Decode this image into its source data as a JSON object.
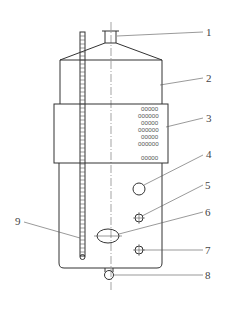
{
  "diagram": {
    "type": "vessel-schematic",
    "callouts": [
      {
        "id": "1",
        "label": "1",
        "part": "top nozzle"
      },
      {
        "id": "2",
        "label": "2",
        "part": "vessel shell"
      },
      {
        "id": "3",
        "label": "3",
        "part": "perforated jacket"
      },
      {
        "id": "4",
        "label": "4",
        "part": "port"
      },
      {
        "id": "5",
        "label": "5",
        "part": "small port"
      },
      {
        "id": "6",
        "label": "6",
        "part": "sight glass"
      },
      {
        "id": "7",
        "label": "7",
        "part": "small port"
      },
      {
        "id": "8",
        "label": "8",
        "part": "bottom outlet"
      },
      {
        "id": "9",
        "label": "9",
        "part": "level gauge"
      }
    ],
    "perforation_rows": [
      "00000",
      "000000",
      "00000",
      "000000",
      "00000",
      "000000",
      "00000"
    ],
    "colors": {
      "line": "#333333",
      "text": "#444444",
      "background": "#ffffff"
    }
  }
}
